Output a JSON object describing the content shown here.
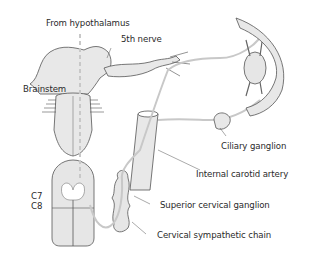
{
  "diagram": {
    "labels": {
      "hypothalamus": "From hypothalamus",
      "fifth_nerve": "5th nerve",
      "brainstem": "Brainstem",
      "c7": "C7",
      "c8": "C8",
      "ciliary_ganglion": "Ciliary ganglion",
      "internal_carotid": "Internal carotid artery",
      "superior_cervical_ganglion": "Superior cervical ganglion",
      "cervical_sympathetic_chain": "Cervical sympathetic chain"
    },
    "colors": {
      "outline": "#555555",
      "fill": "#e6e6e6",
      "pathway": "#c8c8c8",
      "text": "#2a2a2a"
    }
  }
}
